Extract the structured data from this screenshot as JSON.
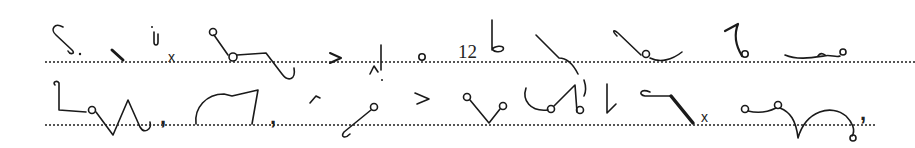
{
  "document": {
    "type": "shorthand-exercise",
    "ink_color": "#1a1a1a",
    "rule_color": "#555555",
    "lines": [
      {
        "index": 1,
        "rule_y": 61,
        "labels": [
          {
            "id": "x-mark-1",
            "text": "x",
            "x": 168,
            "y": 50,
            "size": 14
          },
          {
            "id": "numeral-12",
            "text": "12",
            "x": 458,
            "y": 44,
            "size": 19
          }
        ],
        "outlines": [
          "S-stroke-with-dot",
          "short-heavy-slant",
          "small-j-hook",
          "x-mark",
          "circle-slant-hook",
          "angle-mark",
          "vertical-with-tick",
          "small-circle",
          "numeral-12-b",
          "slant-curve-down",
          "hook-slant-curve",
          "curl-hook",
          "curve-with-circle"
        ]
      },
      {
        "index": 2,
        "rule_y": 124,
        "labels": [
          {
            "id": "comma-1",
            "text": ",",
            "x": 160,
            "y": 106,
            "size": 22
          },
          {
            "id": "comma-2",
            "text": ",",
            "x": 270,
            "y": 106,
            "size": 22
          },
          {
            "id": "x-mark-2",
            "text": "x",
            "x": 701,
            "y": 110,
            "size": 14
          },
          {
            "id": "comma-3",
            "text": ",",
            "x": 860,
            "y": 102,
            "size": 22
          }
        ],
        "outlines": [
          "hook-circle-zigzag",
          "arch-vertical",
          "short-tick",
          "circle-slant",
          "angle-mark",
          "circle-v-circle",
          "curve-circles",
          "vertical-tick",
          "hook-heavy-slant",
          "x-mark",
          "circles-wave-curl"
        ]
      }
    ]
  }
}
